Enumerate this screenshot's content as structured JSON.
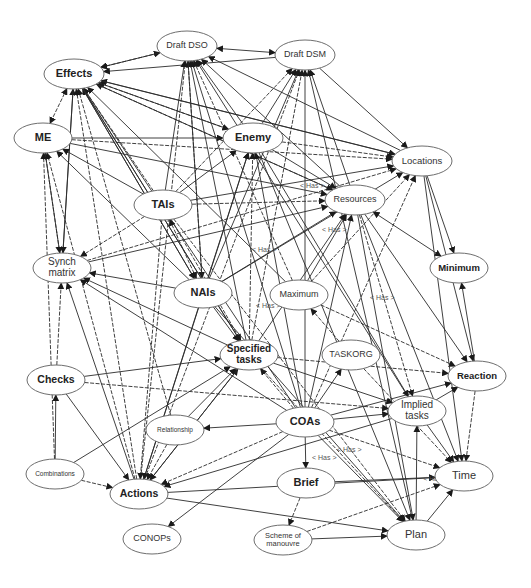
{
  "diagram": {
    "edge_label": "< Has >",
    "nodes": [
      {
        "id": "draft_dso",
        "label": "Draft DSO",
        "x": 187,
        "y": 46,
        "rx": 30,
        "ry": 15,
        "size": 9,
        "bold": false
      },
      {
        "id": "draft_dsm",
        "label": "Draft DSM",
        "x": 305,
        "y": 55,
        "rx": 30,
        "ry": 15,
        "size": 9,
        "bold": false
      },
      {
        "id": "effects",
        "label": "Effects",
        "x": 74,
        "y": 74,
        "rx": 30,
        "ry": 15,
        "size": 11,
        "bold": true
      },
      {
        "id": "me",
        "label": "ME",
        "x": 43,
        "y": 138,
        "rx": 29,
        "ry": 15,
        "size": 11,
        "bold": true
      },
      {
        "id": "enemy",
        "label": "Enemy",
        "x": 253,
        "y": 138,
        "rx": 30,
        "ry": 15,
        "size": 11,
        "bold": true
      },
      {
        "id": "locations",
        "label": "Locations",
        "x": 422,
        "y": 161,
        "rx": 30,
        "ry": 15,
        "size": 9.5,
        "bold": false
      },
      {
        "id": "tais",
        "label": "TAIs",
        "x": 163,
        "y": 205,
        "rx": 29,
        "ry": 15,
        "size": 11,
        "bold": true
      },
      {
        "id": "resources",
        "label": "Resources",
        "x": 355,
        "y": 200,
        "rx": 30,
        "ry": 15,
        "size": 9,
        "bold": false
      },
      {
        "id": "synch_matrix",
        "label": "Synch\nmatrix",
        "x": 62,
        "y": 268,
        "rx": 29,
        "ry": 15,
        "size": 10,
        "bold": false
      },
      {
        "id": "minimum",
        "label": "Minimum",
        "x": 459,
        "y": 268,
        "rx": 29,
        "ry": 15,
        "size": 9.5,
        "bold": true
      },
      {
        "id": "nais",
        "label": "NAIs",
        "x": 203,
        "y": 293,
        "rx": 29,
        "ry": 15,
        "size": 11,
        "bold": true
      },
      {
        "id": "maximum",
        "label": "Maximum",
        "x": 299,
        "y": 295,
        "rx": 29,
        "ry": 15,
        "size": 9,
        "bold": false
      },
      {
        "id": "specified_tasks",
        "label": "Specified\ntasks",
        "x": 249,
        "y": 355,
        "rx": 29,
        "ry": 15,
        "size": 10,
        "bold": true
      },
      {
        "id": "taskorg",
        "label": "TASKORG",
        "x": 351,
        "y": 355,
        "rx": 29,
        "ry": 15,
        "size": 9,
        "bold": false
      },
      {
        "id": "checks",
        "label": "Checks",
        "x": 56,
        "y": 380,
        "rx": 29,
        "ry": 15,
        "size": 10.5,
        "bold": true
      },
      {
        "id": "reaction",
        "label": "Reaction",
        "x": 477,
        "y": 376,
        "rx": 29,
        "ry": 15,
        "size": 9.5,
        "bold": true
      },
      {
        "id": "relationship",
        "label": "Relationship",
        "x": 175,
        "y": 430,
        "rx": 29,
        "ry": 15,
        "size": 6.5,
        "bold": false
      },
      {
        "id": "coas",
        "label": "COAs",
        "x": 305,
        "y": 422,
        "rx": 29,
        "ry": 15,
        "size": 11,
        "bold": true
      },
      {
        "id": "implied_tasks",
        "label": "Implied\ntasks",
        "x": 417,
        "y": 411,
        "rx": 29,
        "ry": 15,
        "size": 10,
        "bold": false
      },
      {
        "id": "combinations",
        "label": "Combinations",
        "x": 55,
        "y": 474,
        "rx": 29,
        "ry": 15,
        "size": 6.5,
        "bold": false
      },
      {
        "id": "actions",
        "label": "Actions",
        "x": 139,
        "y": 494,
        "rx": 29,
        "ry": 15,
        "size": 10.5,
        "bold": true
      },
      {
        "id": "brief",
        "label": "Brief",
        "x": 306,
        "y": 483,
        "rx": 29,
        "ry": 15,
        "size": 11,
        "bold": true
      },
      {
        "id": "time",
        "label": "Time",
        "x": 464,
        "y": 476,
        "rx": 29,
        "ry": 15,
        "size": 11,
        "bold": false
      },
      {
        "id": "conops",
        "label": "CONOPs",
        "x": 152,
        "y": 539,
        "rx": 29,
        "ry": 15,
        "size": 9,
        "bold": false
      },
      {
        "id": "scheme_of_manouvre",
        "label": "Scheme of\nmanouvre",
        "x": 283,
        "y": 540,
        "rx": 29,
        "ry": 15,
        "size": 7.5,
        "bold": false
      },
      {
        "id": "plan",
        "label": "Plan",
        "x": 416,
        "y": 535,
        "rx": 29,
        "ry": 15,
        "size": 11,
        "bold": false
      }
    ],
    "edges": [
      [
        "effects",
        "draft_dso",
        true
      ],
      [
        "draft_dso",
        "draft_dsm",
        true
      ],
      [
        "draft_dsm",
        "effects",
        false
      ],
      [
        "effects",
        "me",
        true
      ],
      [
        "draft_dso",
        "effects",
        false
      ],
      [
        "enemy",
        "effects",
        false
      ],
      [
        "tais",
        "effects",
        false
      ],
      [
        "nais",
        "effects",
        false
      ],
      [
        "specified_tasks",
        "effects",
        false
      ],
      [
        "resources",
        "effects",
        false
      ],
      [
        "locations",
        "effects",
        false
      ],
      [
        "synch_matrix",
        "effects",
        false
      ],
      [
        "actions",
        "effects",
        false
      ],
      [
        "coas",
        "effects",
        false
      ],
      [
        "maximum",
        "effects",
        false
      ],
      [
        "relationship",
        "effects",
        false
      ],
      [
        "enemy",
        "draft_dso",
        false
      ],
      [
        "tais",
        "draft_dso",
        false
      ],
      [
        "nais",
        "draft_dso",
        false
      ],
      [
        "specified_tasks",
        "draft_dso",
        false
      ],
      [
        "resources",
        "draft_dso",
        false
      ],
      [
        "actions",
        "draft_dso",
        false
      ],
      [
        "coas",
        "draft_dso",
        false
      ],
      [
        "implied_tasks",
        "draft_dso",
        false
      ],
      [
        "maximum",
        "draft_dso",
        false
      ],
      [
        "locations",
        "draft_dso",
        false
      ],
      [
        "enemy",
        "draft_dsm",
        false
      ],
      [
        "tais",
        "draft_dsm",
        false
      ],
      [
        "nais",
        "draft_dsm",
        false
      ],
      [
        "resources",
        "draft_dsm",
        false
      ],
      [
        "actions",
        "draft_dsm",
        false
      ],
      [
        "coas",
        "draft_dsm",
        false
      ],
      [
        "plan",
        "draft_dsm",
        false
      ],
      [
        "specified_tasks",
        "draft_dsm",
        false
      ],
      [
        "draft_dsm",
        "locations",
        false
      ],
      [
        "me",
        "enemy",
        false
      ],
      [
        "me",
        "locations",
        false
      ],
      [
        "me",
        "resources",
        false
      ],
      [
        "synch_matrix",
        "me",
        false
      ],
      [
        "actions",
        "me",
        false
      ],
      [
        "tais",
        "me",
        false
      ],
      [
        "nais",
        "me",
        false
      ],
      [
        "combinations",
        "me",
        false
      ],
      [
        "effects",
        "locations",
        false
      ],
      [
        "effects",
        "resources",
        false
      ],
      [
        "effects",
        "enemy",
        false
      ],
      [
        "tais",
        "enemy",
        false
      ],
      [
        "nais",
        "enemy",
        false
      ],
      [
        "specified_tasks",
        "enemy",
        false
      ],
      [
        "actions",
        "enemy",
        false
      ],
      [
        "coas",
        "enemy",
        false
      ],
      [
        "enemy",
        "locations",
        false
      ],
      [
        "enemy",
        "resources",
        false
      ],
      [
        "tais",
        "locations",
        false
      ],
      [
        "tais",
        "resources",
        false
      ],
      [
        "nais",
        "locations",
        false
      ],
      [
        "nais",
        "resources",
        false
      ],
      [
        "synch_matrix",
        "locations",
        false
      ],
      [
        "synch_matrix",
        "resources",
        false
      ],
      [
        "maximum",
        "resources",
        false
      ],
      [
        "maximum",
        "locations",
        false
      ],
      [
        "specified_tasks",
        "resources",
        false
      ],
      [
        "coas",
        "resources",
        false
      ],
      [
        "coas",
        "locations",
        false
      ],
      [
        "resources",
        "minimum",
        true
      ],
      [
        "locations",
        "minimum",
        false
      ],
      [
        "tais",
        "nais",
        true
      ],
      [
        "effects",
        "nais",
        false
      ],
      [
        "draft_dso",
        "nais",
        false
      ],
      [
        "tais",
        "synch_matrix",
        false
      ],
      [
        "nais",
        "synch_matrix",
        false
      ],
      [
        "effects",
        "synch_matrix",
        false
      ],
      [
        "me",
        "synch_matrix",
        false
      ],
      [
        "specified_tasks",
        "synch_matrix",
        false
      ],
      [
        "coas",
        "synch_matrix",
        false
      ],
      [
        "checks",
        "synch_matrix",
        false
      ],
      [
        "actions",
        "synch_matrix",
        false
      ],
      [
        "nais",
        "specified_tasks",
        false
      ],
      [
        "tais",
        "specified_tasks",
        false
      ],
      [
        "effects",
        "specified_tasks",
        false
      ],
      [
        "checks",
        "specified_tasks",
        false
      ],
      [
        "coas",
        "specified_tasks",
        false
      ],
      [
        "relationship",
        "specified_tasks",
        false
      ],
      [
        "actions",
        "specified_tasks",
        false
      ],
      [
        "checks",
        "implied_tasks",
        false
      ],
      [
        "checks",
        "actions",
        false
      ],
      [
        "reaction",
        "minimum",
        false
      ],
      [
        "maximum",
        "reaction",
        false
      ],
      [
        "resources",
        "reaction",
        false
      ],
      [
        "locations",
        "reaction",
        false
      ],
      [
        "specified_tasks",
        "reaction",
        false
      ],
      [
        "coas",
        "reaction",
        false
      ],
      [
        "coas",
        "taskorg",
        false
      ],
      [
        "taskorg",
        "maximum",
        false
      ],
      [
        "coas",
        "implied_tasks",
        false
      ],
      [
        "specified_tasks",
        "implied_tasks",
        false
      ],
      [
        "resources",
        "implied_tasks",
        false
      ],
      [
        "enemy",
        "implied_tasks",
        false
      ],
      [
        "coas",
        "relationship",
        false
      ],
      [
        "coas",
        "actions",
        false
      ],
      [
        "coas",
        "brief",
        false
      ],
      [
        "coas",
        "plan",
        false
      ],
      [
        "coas",
        "time",
        false
      ],
      [
        "coas",
        "conops",
        false
      ],
      [
        "implied_tasks",
        "actions",
        false
      ],
      [
        "combinations",
        "actions",
        false
      ],
      [
        "combinations",
        "specified_tasks",
        false
      ],
      [
        "combinations",
        "checks",
        false
      ],
      [
        "relationship",
        "actions",
        false
      ],
      [
        "specified_tasks",
        "actions",
        false
      ],
      [
        "nais",
        "actions",
        false
      ],
      [
        "tais",
        "actions",
        false
      ],
      [
        "actions",
        "time",
        false
      ],
      [
        "actions",
        "plan",
        false
      ],
      [
        "brief",
        "scheme_of_manouvre",
        false
      ],
      [
        "brief",
        "time",
        false
      ],
      [
        "scheme_of_manouvre",
        "plan",
        false
      ],
      [
        "scheme_of_manouvre",
        "time",
        false
      ],
      [
        "plan",
        "implied_tasks",
        false
      ],
      [
        "plan",
        "time",
        false
      ],
      [
        "specified_tasks",
        "plan",
        false
      ],
      [
        "resources",
        "plan",
        false
      ],
      [
        "enemy",
        "plan",
        false
      ],
      [
        "tais",
        "plan",
        false
      ],
      [
        "nais",
        "plan",
        false
      ],
      [
        "implied_tasks",
        "time",
        false
      ],
      [
        "reaction",
        "time",
        false
      ],
      [
        "locations",
        "time",
        false
      ],
      [
        "resources",
        "time",
        false
      ],
      [
        "taskorg",
        "time",
        false
      ],
      [
        "implied_tasks",
        "reaction",
        false
      ]
    ],
    "edge_labels": [
      {
        "x": 300,
        "y": 188
      },
      {
        "x": 252,
        "y": 252
      },
      {
        "x": 322,
        "y": 232
      },
      {
        "x": 256,
        "y": 308
      },
      {
        "x": 370,
        "y": 300
      },
      {
        "x": 312,
        "y": 460
      },
      {
        "x": 337,
        "y": 452
      },
      {
        "x": 423,
        "y": 481
      }
    ]
  }
}
